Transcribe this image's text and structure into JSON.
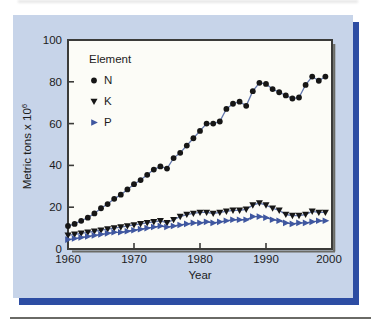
{
  "figure": {
    "kind": "textbook-chart-panel"
  },
  "colors": {
    "panel_bg": "#c7d4e9",
    "panel_shadow": "#2d4da3",
    "plot_bg": "#fcfcf7",
    "plot_border": "#3b3b39",
    "plot_border_shadow": "#6b6b66",
    "text": "#1c1c1c",
    "n_marker": "#161616",
    "k_marker": "#161616",
    "p_color": "#3f57a0",
    "connect_line": "#6478ad",
    "bottom_rule": "#6a6a66"
  },
  "chart_data": {
    "type": "line",
    "title": "",
    "xlabel": "Year",
    "ylabel_base": "Metric tons x 10",
    "ylabel_exponent": "6",
    "xlim": [
      1960,
      2000
    ],
    "ylim": [
      0,
      100
    ],
    "xticks": [
      1960,
      1970,
      1980,
      1990,
      2000
    ],
    "yticks": [
      0,
      20,
      40,
      60,
      80,
      100
    ],
    "grid": false,
    "legend": {
      "title": "Element",
      "position": "upper-left-inside",
      "items": [
        {
          "label": "N",
          "marker": "circle",
          "color": "#161616"
        },
        {
          "label": "K",
          "marker": "triangle-down",
          "color": "#161616"
        },
        {
          "label": "P",
          "marker": "triangle-right",
          "color": "#3f57a0"
        }
      ]
    },
    "x": [
      1960,
      1961,
      1962,
      1963,
      1964,
      1965,
      1966,
      1967,
      1968,
      1969,
      1970,
      1971,
      1972,
      1973,
      1974,
      1975,
      1976,
      1977,
      1978,
      1979,
      1980,
      1981,
      1982,
      1983,
      1984,
      1985,
      1986,
      1987,
      1988,
      1989,
      1990,
      1991,
      1992,
      1993,
      1994,
      1995,
      1996,
      1997,
      1998,
      1999
    ],
    "series": [
      {
        "name": "N",
        "marker": "circle",
        "marker_color": "#161616",
        "line_color": "#6478ad",
        "values": [
          11,
          12,
          13.5,
          15,
          17,
          19.5,
          21.5,
          24,
          26,
          28.5,
          31,
          33,
          35.5,
          38,
          39.5,
          38.5,
          43.5,
          46,
          49.5,
          53,
          56.5,
          60,
          60,
          61,
          67,
          69.5,
          70.5,
          68.5,
          75.5,
          79.5,
          79,
          76.5,
          75,
          73.5,
          72,
          72.5,
          78.5,
          82.5,
          80.5,
          82.5
        ]
      },
      {
        "name": "K",
        "marker": "triangle-down",
        "marker_color": "#161616",
        "line_color": "#6478ad",
        "values": [
          6.5,
          7,
          7.5,
          8,
          8.5,
          9,
          9.5,
          10,
          10.5,
          11,
          11.5,
          12,
          12.5,
          13,
          13.5,
          12.5,
          14,
          15.5,
          16.5,
          17,
          17.5,
          17.5,
          17,
          17.5,
          18,
          18.5,
          18.5,
          19,
          21,
          22,
          21,
          19.5,
          18.5,
          16.5,
          16,
          16,
          16.5,
          18,
          17.5,
          17.5
        ]
      },
      {
        "name": "P",
        "marker": "triangle-right",
        "marker_color": "#3f57a0",
        "line_color": "#3f57a0",
        "values": [
          4.5,
          5,
          5.5,
          6,
          6.5,
          7,
          7.5,
          8,
          8,
          8.5,
          9,
          9.5,
          10,
          10.5,
          11,
          10.5,
          11,
          11.5,
          12,
          12.5,
          12.5,
          13,
          12.5,
          13,
          13.5,
          14,
          14,
          14,
          15.5,
          15.5,
          15,
          14,
          13.5,
          12.5,
          12,
          12.5,
          12.5,
          13,
          13.5,
          13.5
        ]
      }
    ]
  }
}
